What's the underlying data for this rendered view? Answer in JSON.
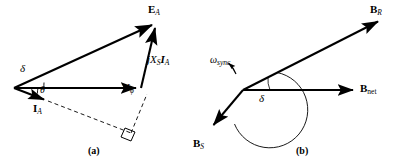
{
  "figure": {
    "width": 406,
    "height": 166,
    "background": "#ffffff",
    "stroke_color": "#000000",
    "panels": [
      {
        "id": "a",
        "caption": "(a)",
        "title": "Phasor diagram of a synchronous generator",
        "type": "phasor-diagram",
        "vectors": [
          {
            "name": "E_A",
            "label_main": "E",
            "label_sub": "A",
            "sub_style": "italic",
            "style": "solid-arrow",
            "from": [
              14,
              88
            ],
            "to": [
              157,
              22
            ],
            "label_pos": [
              150,
              6
            ]
          },
          {
            "name": "V_phi",
            "label_main": "V",
            "label_sub": "ϕ",
            "sub_style": "italic",
            "style": "solid-arrow",
            "from": [
              14,
              88
            ],
            "to": [
              141,
              88
            ],
            "label_pos": [
              126,
              84
            ]
          },
          {
            "name": "jXsIa",
            "label_main": "jX",
            "label_sub": "S",
            "label_main2": "I",
            "label_sub2": "A",
            "style": "solid-arrow",
            "from": [
              141,
              88
            ],
            "to": [
              157,
              22
            ],
            "label_pos": [
              150,
              55
            ]
          },
          {
            "name": "I_A",
            "label_main": "I",
            "label_sub": "A",
            "sub_style": "italic",
            "style": "solid-arrow",
            "from": [
              14,
              88
            ],
            "to": [
              48,
              101
            ],
            "label_pos": [
              36,
              106
            ]
          }
        ],
        "dashed_lines": [
          {
            "name": "current-extension",
            "from": [
              48,
              101
            ],
            "to": [
              130,
              132
            ]
          },
          {
            "name": "perpendicular-drop",
            "from": [
              130,
              132
            ],
            "to": [
              146,
              95
            ]
          }
        ],
        "right_angle_marker": {
          "at": [
            130,
            132
          ],
          "size": 9
        },
        "angles": [
          {
            "name": "delta",
            "symbol": "δ",
            "label_pos": [
              22,
              66
            ],
            "arc_r": 30
          },
          {
            "name": "theta",
            "symbol": "θ",
            "label_pos": [
              38,
              88
            ],
            "arc_r": 24
          }
        ]
      },
      {
        "id": "b",
        "caption": "(b)",
        "title": "Corresponding magnetic field diagram",
        "type": "field-diagram",
        "vectors": [
          {
            "name": "B_R",
            "label_main": "B",
            "label_sub": "R",
            "sub_style": "italic",
            "style": "solid-arrow",
            "from": [
              243,
              90
            ],
            "to": [
              383,
              19
            ],
            "label_pos": [
              372,
              5
            ]
          },
          {
            "name": "B_net",
            "label_main": "B",
            "label_sub": "net",
            "sub_style": "upright",
            "style": "solid-arrow",
            "from": [
              243,
              90
            ],
            "to": [
              358,
              90
            ],
            "label_pos": [
              362,
              85
            ]
          },
          {
            "name": "B_S",
            "label_main": "B",
            "label_sub": "S",
            "sub_style": "italic",
            "style": "solid-arrow",
            "from": [
              243,
              90
            ],
            "to": [
              210,
              129
            ],
            "label_pos": [
              195,
              140
            ]
          }
        ],
        "rotation": {
          "name": "omega-sync",
          "symbol": "ω",
          "sub": "sync",
          "label_pos": [
            212,
            54
          ],
          "direction": "counterclockwise"
        },
        "angles": [
          {
            "name": "delta",
            "symbol": "δ",
            "label_pos": [
              262,
              97
            ],
            "arc_r": 40
          }
        ]
      }
    ]
  }
}
